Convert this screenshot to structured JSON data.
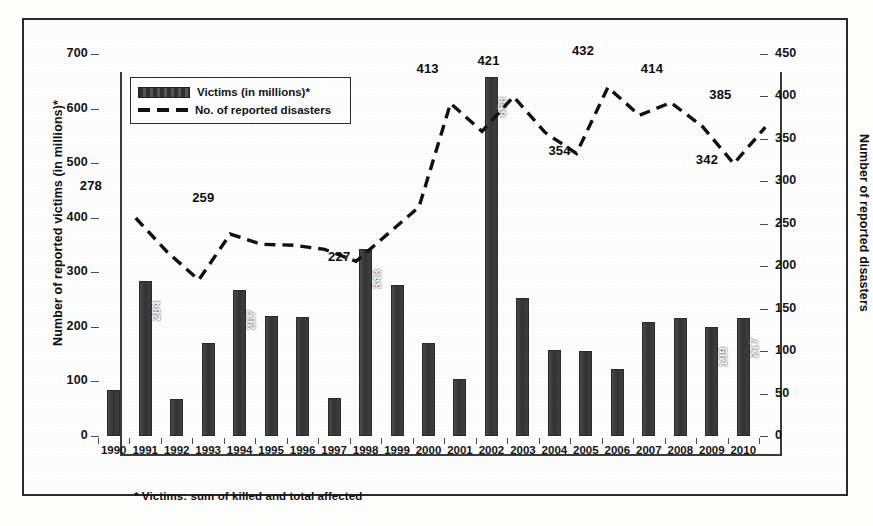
{
  "chart_data": {
    "type": "bar",
    "title": "",
    "subtitle": "",
    "categories": [
      "1990",
      "1991",
      "1992",
      "1993",
      "1994",
      "1995",
      "1996",
      "1997",
      "1998",
      "1999",
      "2000",
      "2001",
      "2002",
      "2003",
      "2004",
      "2005",
      "2006",
      "2007",
      "2008",
      "2009",
      "2010"
    ],
    "xlabel": "",
    "ylabel": "Number of reported victims (in millions)*",
    "y2label": "Number of reported disasters",
    "ylim": [
      0,
      700
    ],
    "y2lim": [
      0,
      450
    ],
    "yticks": [
      0,
      100,
      200,
      300,
      400,
      500,
      600,
      700
    ],
    "y2ticks": [
      0,
      50,
      100,
      150,
      200,
      250,
      300,
      350,
      400,
      450
    ],
    "grid": false,
    "legend_position": "top-left",
    "series": [
      {
        "name": "Victims (in millions)*",
        "type": "bar",
        "axis": "left",
        "color": "#3c3c3c",
        "values": [
          85,
          284,
          68,
          170,
          267,
          220,
          218,
          69,
          343,
          277,
          170,
          105,
          658,
          252,
          158,
          156,
          122,
          208,
          216,
          199,
          217
        ],
        "data_labels": {
          "1991": "284",
          "1994": "267",
          "1998": "343",
          "2002": "658",
          "2009": "199",
          "2010": "217"
        }
      },
      {
        "name": "No. of reported disasters",
        "type": "line",
        "style": "dashed",
        "axis": "right",
        "color": "#111111",
        "values": [
          278,
          238,
          205,
          259,
          247,
          246,
          241,
          227,
          259,
          291,
          413,
          380,
          421,
          379,
          354,
          432,
          399,
          414,
          386,
          342,
          385
        ],
        "data_labels": {
          "1990": "278",
          "1993": "259",
          "1997": "227",
          "2000": "413",
          "2002": "421",
          "2004": "354",
          "2005": "432",
          "2007": "414",
          "2009": "342",
          "2010": "385"
        }
      }
    ],
    "annotations": [
      {
        "text": "* Victims: sum of killed and total affected"
      }
    ]
  },
  "legend": {
    "items": [
      {
        "label": "Victims (in millions)*",
        "marker": "bar-swatch"
      },
      {
        "label": "No. of reported disasters",
        "marker": "dashed-line-swatch"
      }
    ]
  },
  "footnote": {
    "text": "* Victims: sum of killed and total affected"
  },
  "colors": {
    "bar": "#3c3c3c",
    "line": "#111111",
    "axis": "#3a3a3a",
    "text": "#111111",
    "frame": "#2b2b2b",
    "background": "#fefefe"
  }
}
